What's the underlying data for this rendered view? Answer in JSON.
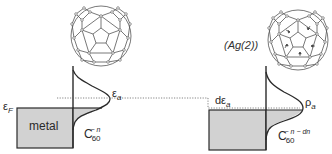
{
  "diagram": {
    "type": "energy-level schematic",
    "colors": {
      "line": "#2a2a2a",
      "fill": "#d2d2d2",
      "dotted": "#555555"
    },
    "left_panel": {
      "metal_label": "metal",
      "fermi_label": {
        "base": "ε",
        "sub": "F"
      },
      "level_label": {
        "base": "ε",
        "sub": "a"
      },
      "molecule_label": {
        "base": "C",
        "sub": "60",
        "sup": "− n"
      }
    },
    "right_panel": {
      "site_label": "(Ag(2))",
      "shift_label": {
        "base": "dε",
        "sub": "a"
      },
      "density_label": {
        "base": "ρ",
        "sub": "a"
      },
      "molecule_label": {
        "base": "C",
        "sub": "60",
        "sup": "− n − dn"
      }
    }
  }
}
